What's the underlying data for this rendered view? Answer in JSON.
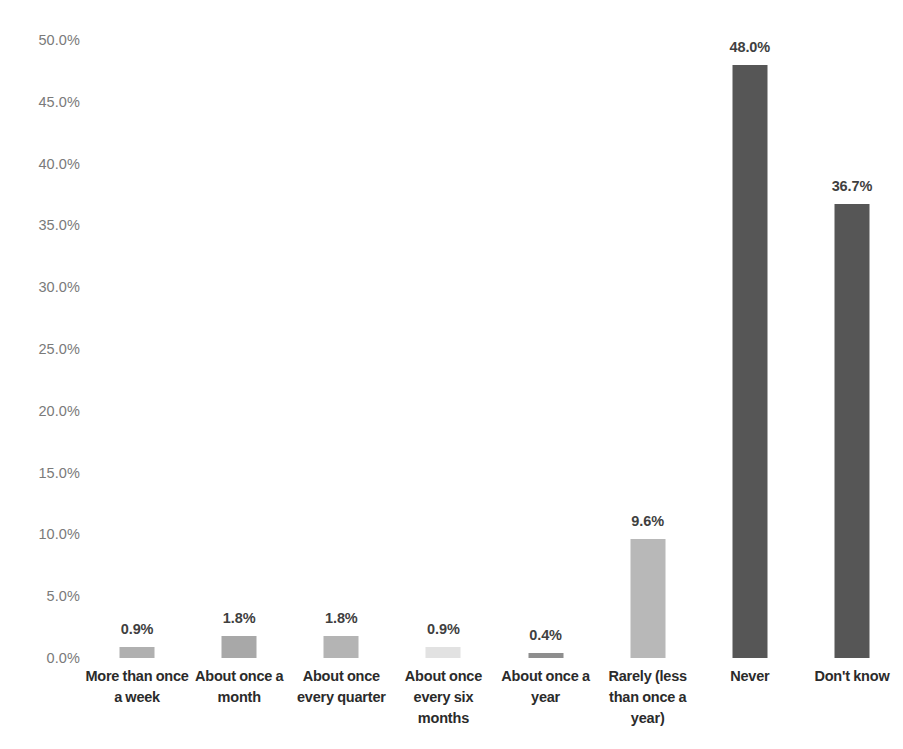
{
  "chart_data": {
    "type": "bar",
    "title": "",
    "subtitle": "",
    "xlabel": "",
    "ylabel": "",
    "ylim": [
      0,
      50
    ],
    "grid": false,
    "legend": false,
    "legend_position": "none",
    "y_ticks": [
      "0.0%",
      "5.0%",
      "10.0%",
      "15.0%",
      "20.0%",
      "25.0%",
      "30.0%",
      "35.0%",
      "40.0%",
      "45.0%",
      "50.0%"
    ],
    "y_tick_values": [
      0,
      5,
      10,
      15,
      20,
      25,
      30,
      35,
      40,
      45,
      50
    ],
    "categories": [
      "More than once a week",
      "About once a month",
      "About once every quarter",
      "About once every six months",
      "About once a year",
      "Rarely (less than once a year)",
      "Never",
      "Don't know"
    ],
    "values": [
      0.9,
      1.8,
      1.8,
      0.9,
      0.4,
      9.6,
      48.0,
      36.7
    ],
    "data_labels": [
      "0.9%",
      "1.8%",
      "1.8%",
      "0.9%",
      "0.4%",
      "9.6%",
      "48.0%",
      "36.7%"
    ],
    "bar_colors": [
      "#b0b0b0",
      "#a8a8a8",
      "#b4b4b4",
      "#e2e2e2",
      "#8e8e8e",
      "#b8b8b8",
      "#565656",
      "#565656"
    ]
  },
  "axis": {
    "tick_color": "#7a7a7a",
    "label_color": "#2b2b2b",
    "value_label_color": "#3f3f3f"
  }
}
